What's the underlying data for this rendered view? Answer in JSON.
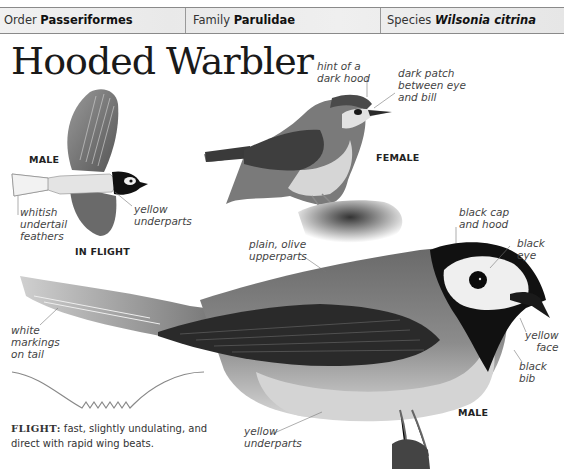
{
  "taxonomy": {
    "order_label": "Order",
    "order_value": "Passeriformes",
    "family_label": "Family",
    "family_value": "Parulidae",
    "species_label": "Species",
    "species_value": "Wilsonia citrina"
  },
  "title": "Hooded Warbler",
  "figures": {
    "in_flight": {
      "sex_caption": "MALE",
      "caption": "IN FLIGHT",
      "labels": [
        "whitish undertail feathers",
        "yellow underparts"
      ]
    },
    "female": {
      "caption": "FEMALE",
      "labels": [
        "hint of a dark hood",
        "dark patch between eye and bill"
      ]
    },
    "male_perched": {
      "caption": "MALE",
      "labels": [
        "plain, olive upperparts",
        "black cap and hood",
        "black eye",
        "white markings on tail",
        "yellow face",
        "black bib",
        "yellow underparts"
      ]
    }
  },
  "labels": {
    "whitish_1": "whitish",
    "whitish_2": "undertail",
    "whitish_3": "feathers",
    "yellow_flight_1": "yellow",
    "yellow_flight_2": "underparts",
    "hint_1": "hint of a",
    "hint_2": "dark hood",
    "patch_1": "dark patch",
    "patch_2": "between eye",
    "patch_3": "and bill",
    "cap_1": "black cap",
    "cap_2": "and hood",
    "eye": "black eye",
    "plain_1": "plain, olive",
    "plain_2": "upperparts",
    "white_1": "white",
    "white_2": "markings",
    "white_3": "on tail",
    "face_1": "yellow",
    "face_2": "face",
    "bib": "black bib",
    "under_1": "yellow",
    "under_2": "underparts"
  },
  "flight_note": {
    "heading": "FLIGHT:",
    "text": " fast, slightly undulating, and direct with rapid wing beats."
  },
  "colors": {
    "header_bg": "#ececec",
    "text": "#222222",
    "leader_line": "#777777"
  }
}
